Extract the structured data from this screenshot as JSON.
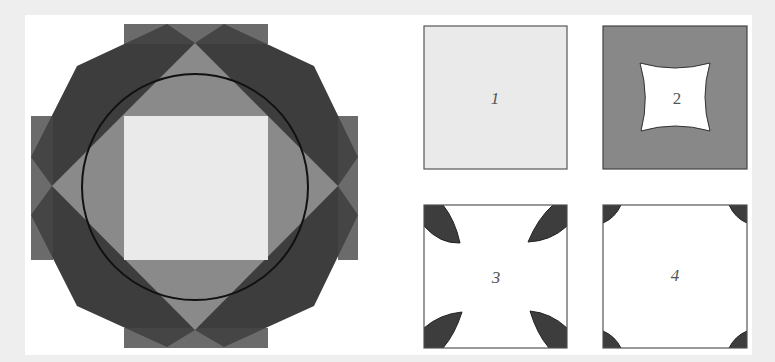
{
  "figure": {
    "main_diagram": {
      "description": "Circle inscribed between a rotated square and an axis-aligned square, surrounded by overlapping dark rotated squares",
      "colors": {
        "dark": "#3d3d3d",
        "dark_band": "#444444",
        "mid_gray": "#8a8a8a",
        "light": "#eaeaea",
        "circle_stroke": "#111111"
      }
    },
    "panels": [
      {
        "id": 1,
        "label": "1",
        "fill": "#eaeaea",
        "description": "Plain light square"
      },
      {
        "id": 2,
        "label": "2",
        "fill": "#888888",
        "description": "Gray square with white concave curved square cut-out"
      },
      {
        "id": 3,
        "label": "3",
        "fill": "#ffffff",
        "description": "White square with four dark lens-shaped corner pieces"
      },
      {
        "id": 4,
        "label": "4",
        "fill": "#ffffff",
        "description": "White square with four small dark quarter-circle corners"
      }
    ]
  }
}
